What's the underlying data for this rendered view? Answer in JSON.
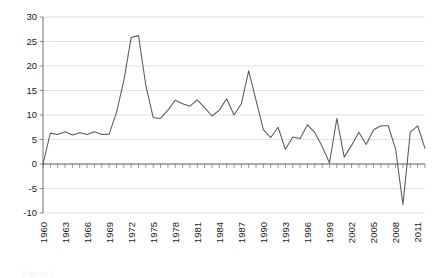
{
  "chart_data": {
    "type": "line",
    "title": "",
    "subtitle": "",
    "xlabel": "",
    "ylabel": "",
    "xlim": [
      1960,
      2012
    ],
    "ylim": [
      -10,
      30
    ],
    "ytick_step": 5,
    "xtick_step": 1,
    "xlabel_step": 3,
    "grid": true,
    "legend": false,
    "legend_position": "none",
    "line_color": "#595959",
    "grid_color": "#d9d9d9",
    "axis_color": "#6e6e6e",
    "yticks": [
      30,
      25,
      20,
      15,
      10,
      5,
      0,
      -5,
      -10
    ],
    "ytick_labels": [
      "30",
      "25",
      "20",
      "15",
      "10",
      "5",
      "0",
      "-5",
      "-10"
    ],
    "xtick_labels": [
      "1960",
      "1963",
      "1966",
      "1969",
      "1972",
      "1975",
      "1978",
      "1981",
      "1984",
      "1987",
      "1990",
      "1993",
      "1996",
      "1999",
      "2002",
      "2005",
      "2008",
      "2011"
    ],
    "x": [
      1960,
      1961,
      1962,
      1963,
      1964,
      1965,
      1966,
      1967,
      1968,
      1969,
      1970,
      1971,
      1972,
      1973,
      1974,
      1975,
      1976,
      1977,
      1978,
      1979,
      1980,
      1981,
      1982,
      1983,
      1984,
      1985,
      1986,
      1987,
      1988,
      1989,
      1990,
      1991,
      1992,
      1993,
      1994,
      1995,
      1996,
      1997,
      1998,
      1999,
      2000,
      2001,
      2002,
      2003,
      2004,
      2005,
      2006,
      2007,
      2008,
      2009,
      2010,
      2011,
      2012
    ],
    "values": [
      0,
      6.3,
      6.0,
      6.6,
      5.9,
      6.4,
      6.0,
      6.6,
      6.0,
      6.1,
      10.5,
      17.0,
      25.8,
      26.2,
      16.0,
      9.5,
      9.3,
      11.0,
      13.0,
      12.3,
      11.8,
      13.1,
      11.5,
      9.8,
      11.0,
      13.3,
      10.0,
      12.3,
      19.0,
      13.0,
      7.0,
      5.4,
      7.5,
      3.0,
      5.5,
      5.2,
      8.0,
      6.4,
      3.6,
      0.2,
      9.3,
      1.4,
      3.8,
      6.5,
      4.0,
      7.0,
      7.8,
      7.8,
      3.0,
      -8.3,
      6.5,
      7.8,
      3.2
    ],
    "series": [
      {
        "name": "series-1",
        "values": [
          0,
          6.3,
          6.0,
          6.6,
          5.9,
          6.4,
          6.0,
          6.6,
          6.0,
          6.1,
          10.5,
          17.0,
          25.8,
          26.2,
          16.0,
          9.5,
          9.3,
          11.0,
          13.0,
          12.3,
          11.8,
          13.1,
          11.5,
          9.8,
          11.0,
          13.3,
          10.0,
          12.3,
          19.0,
          13.0,
          7.0,
          5.4,
          7.5,
          3.0,
          5.5,
          5.2,
          8.0,
          6.4,
          3.6,
          0.2,
          9.3,
          1.4,
          3.8,
          6.5,
          4.0,
          7.0,
          7.8,
          7.8,
          3.0,
          -8.3,
          6.5,
          7.8,
          3.2
        ]
      }
    ],
    "annotations": []
  },
  "caption": {
    "text": "Figure 1."
  }
}
